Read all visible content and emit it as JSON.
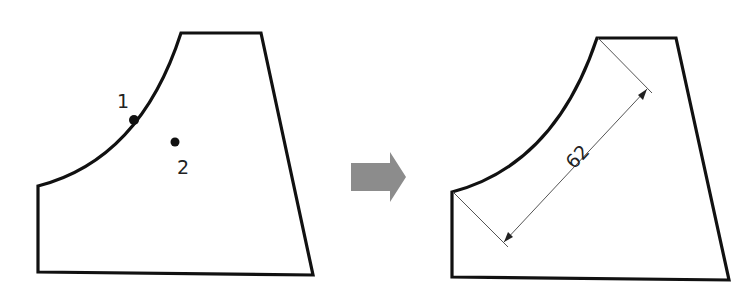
{
  "left_figure": {
    "point_labels": [
      "1",
      "2"
    ]
  },
  "arrow": {
    "icon": "right-arrow-icon",
    "color": "#8c8c8c"
  },
  "right_figure": {
    "dimension_value": "62"
  },
  "colors": {
    "outline": "#111111",
    "dimension_line": "#555555",
    "background": "#ffffff"
  }
}
